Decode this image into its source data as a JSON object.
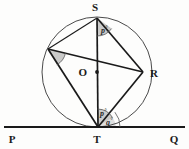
{
  "figure": {
    "type": "circle-geometry-diagram",
    "background_color": "#fdfdfc"
  },
  "colors": {
    "stroke": "#1a1a1a",
    "circle_stroke": "#4a4a4a",
    "chord_stroke": "#1a1a1a",
    "angle_fill": "#b8b8b8",
    "angle_arc": "#555555",
    "label_color": "#1a1a1a"
  },
  "circle": {
    "center_x": 97,
    "center_y": 72,
    "radius": 55,
    "center_label": "O",
    "center_dot": true
  },
  "points": [
    {
      "name": "point-s",
      "label": "S",
      "x": 97,
      "y": 18,
      "label_x": 95,
      "label_y": 11
    },
    {
      "name": "point-r",
      "label": "R",
      "x": 143,
      "y": 72,
      "label_x": 150,
      "label_y": 77
    },
    {
      "name": "point-t",
      "label": "T",
      "x": 98,
      "y": 127,
      "label_x": 95,
      "label_y": 143
    },
    {
      "name": "point-o",
      "label": "O",
      "x": 97,
      "y": 72,
      "label_x": 80,
      "label_y": 76
    },
    {
      "name": "point-u",
      "label": "",
      "x": 48,
      "y": 49,
      "label_x": 0,
      "label_y": 0
    },
    {
      "name": "point-p",
      "label": "P",
      "x": 10,
      "y": 127,
      "label_x": 9,
      "label_y": 143
    },
    {
      "name": "point-q",
      "label": "Q",
      "x": 178,
      "y": 127,
      "label_x": 172,
      "label_y": 143
    }
  ],
  "tangent_line": {
    "name": "tangent-line-pq",
    "from_label": "P",
    "to_label": "Q",
    "x1": 4,
    "y1": 127,
    "x2": 185,
    "y2": 127,
    "touch_point": "T"
  },
  "chords": [
    {
      "name": "chord-s-t",
      "from": "S",
      "to": "T"
    },
    {
      "name": "chord-s-r",
      "from": "S",
      "to": "R"
    },
    {
      "name": "chord-r-t",
      "from": "R",
      "to": "T"
    },
    {
      "name": "chord-u-r",
      "from": "U",
      "to": "R"
    },
    {
      "name": "chord-u-t",
      "from": "U",
      "to": "T"
    },
    {
      "name": "chord-u-s",
      "from": "U",
      "to": "S"
    }
  ],
  "angles": [
    {
      "name": "angle-at-s",
      "vertex": "S",
      "label": "p",
      "degree_symbol": "°",
      "shaded": true,
      "label_x": 101,
      "label_y": 33
    },
    {
      "name": "angle-at-u",
      "vertex": "U",
      "label": "",
      "degree_symbol": "",
      "shaded": true,
      "label_x": 0,
      "label_y": 0
    },
    {
      "name": "angle-p-at-t",
      "vertex": "T",
      "label": "p",
      "degree_symbol": "°",
      "shaded": true,
      "label_x": 100,
      "label_y": 114
    },
    {
      "name": "angle-q-at-t",
      "vertex": "T",
      "label": "q",
      "degree_symbol": "°",
      "shaded": true,
      "label_x": 105,
      "label_y": 124
    }
  ]
}
